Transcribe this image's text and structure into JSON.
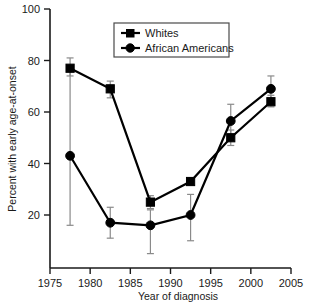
{
  "chart_data": {
    "type": "line",
    "title": "",
    "xlabel": "Year of diagnosis",
    "ylabel": "Percent with early age-at-onset",
    "xlim": [
      1975,
      2005
    ],
    "ylim": [
      0,
      100
    ],
    "xticks": [
      1975,
      1980,
      1985,
      1990,
      1995,
      2000,
      2005
    ],
    "yticks": [
      20,
      40,
      60,
      80,
      100
    ],
    "grid": false,
    "legend_position": "top-center",
    "x": [
      1977.5,
      1982.5,
      1987.5,
      1992.5,
      1997.5,
      2002.5
    ],
    "series": [
      {
        "name": "Whites",
        "marker": "square",
        "values": [
          77,
          69,
          25,
          33,
          50,
          64
        ],
        "err_low": [
          74,
          65.5,
          22.5,
          31.5,
          47,
          62
        ],
        "err_high": [
          81,
          72,
          27.5,
          34.5,
          53,
          66.5
        ]
      },
      {
        "name": "African Americans",
        "marker": "circle",
        "values": [
          43,
          17,
          16,
          20,
          56.5,
          69
        ],
        "err_low": [
          16,
          11,
          5,
          10,
          50,
          65
        ],
        "err_high": [
          77,
          23,
          22,
          28,
          63,
          74
        ]
      }
    ]
  },
  "axes": {
    "x_tick_labels": [
      "1975",
      "1980",
      "1985",
      "1990",
      "1995",
      "2000",
      "2005"
    ],
    "y_tick_labels": [
      "20",
      "40",
      "60",
      "80",
      "100"
    ],
    "x_axis_title": "Year of diagnosis",
    "y_axis_title": "Percent with early age-at-onset"
  },
  "legend": {
    "items": [
      {
        "label": "Whites",
        "marker": "square-marker-icon"
      },
      {
        "label": "African Americans",
        "marker": "circle-marker-icon"
      }
    ]
  }
}
